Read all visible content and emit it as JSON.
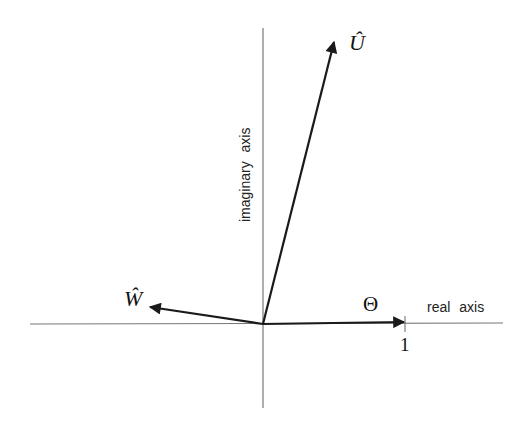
{
  "diagram": {
    "type": "complex-plane-vector-diagram",
    "axes": {
      "real": {
        "label": "real axis",
        "tick_label": "1"
      },
      "imaginary": {
        "label": "imaginary axis"
      }
    },
    "vectors": [
      {
        "name": "U",
        "label": "Û",
        "direction": "up-right, steep"
      },
      {
        "name": "W",
        "label": "Ŵ",
        "direction": "left, slightly up"
      },
      {
        "name": "Theta",
        "label": "Θ",
        "direction": "right along real axis to 1"
      }
    ],
    "colors": {
      "axis": "#777777",
      "vector": "#1a1a1a",
      "background": "#ffffff"
    }
  }
}
